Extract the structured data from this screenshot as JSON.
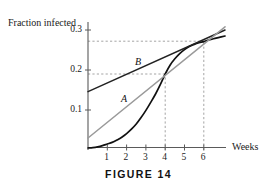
{
  "figure": {
    "caption": "FIGURE 14",
    "y_axis_title": "Fraction infected",
    "x_axis_title": "Weeks"
  },
  "labels": {
    "curve_a": "A",
    "curve_b": "B"
  },
  "chart_data": {
    "type": "line",
    "title": "FIGURE 14",
    "xlabel": "Weeks",
    "ylabel": "Fraction infected",
    "xlim": [
      0,
      7.1
    ],
    "ylim": [
      0,
      0.335
    ],
    "xticks": [
      1,
      2,
      3,
      4,
      5,
      6
    ],
    "xtick_labels": [
      "1",
      "2",
      "3",
      "4",
      "5",
      "6"
    ],
    "yticks": [
      0.1,
      0.2,
      0.3
    ],
    "ytick_labels": [
      "0.1",
      "0.2",
      "0.3"
    ],
    "grid": false,
    "legend": "none",
    "series": [
      {
        "name": "infection-curve",
        "label": "",
        "type": "curve",
        "color": "#111111",
        "width": 1.7,
        "points": [
          [
            0.0,
            0.005
          ],
          [
            0.25,
            0.006
          ],
          [
            0.5,
            0.008
          ],
          [
            0.75,
            0.011
          ],
          [
            1.0,
            0.015
          ],
          [
            1.25,
            0.019
          ],
          [
            1.5,
            0.025
          ],
          [
            1.75,
            0.032
          ],
          [
            2.0,
            0.041
          ],
          [
            2.25,
            0.052
          ],
          [
            2.5,
            0.065
          ],
          [
            2.75,
            0.081
          ],
          [
            3.0,
            0.099
          ],
          [
            3.25,
            0.119
          ],
          [
            3.5,
            0.14
          ],
          [
            3.75,
            0.164
          ],
          [
            4.0,
            0.19
          ],
          [
            4.25,
            0.212
          ],
          [
            4.5,
            0.228
          ],
          [
            4.75,
            0.241
          ],
          [
            5.0,
            0.251
          ],
          [
            5.25,
            0.259
          ],
          [
            5.5,
            0.264
          ],
          [
            5.75,
            0.268
          ],
          [
            6.0,
            0.271
          ],
          [
            6.25,
            0.275
          ],
          [
            6.5,
            0.278
          ],
          [
            6.75,
            0.281
          ],
          [
            7.1,
            0.285
          ]
        ]
      },
      {
        "name": "line-b",
        "label": "B",
        "type": "line",
        "color": "#222222",
        "width": 1.5,
        "points": [
          [
            0.0,
            0.146
          ],
          [
            7.1,
            0.3
          ]
        ]
      },
      {
        "name": "line-a",
        "label": "A",
        "type": "line",
        "color": "#9a9a9a",
        "width": 1.5,
        "points": [
          [
            0.0,
            0.03
          ],
          [
            7.1,
            0.308
          ]
        ]
      }
    ],
    "annotations": [
      {
        "name": "dashed-h-upper",
        "type": "hline",
        "y": 0.272,
        "x_from": 0.0,
        "x_to": 6.0
      },
      {
        "name": "dashed-h-lower",
        "type": "hline",
        "y": 0.19,
        "x_from": 0.0,
        "x_to": 4.0
      },
      {
        "name": "dashed-v-four",
        "type": "vline",
        "x": 4.0,
        "y_from": 0.0,
        "y_to": 0.19
      },
      {
        "name": "dashed-v-six",
        "type": "vline",
        "x": 6.0,
        "y_from": 0.0,
        "y_to": 0.272
      }
    ],
    "label_positions": [
      {
        "name": "A",
        "x": 1.78,
        "y": 0.127
      },
      {
        "name": "B",
        "x": 2.52,
        "y": 0.225
      }
    ]
  }
}
